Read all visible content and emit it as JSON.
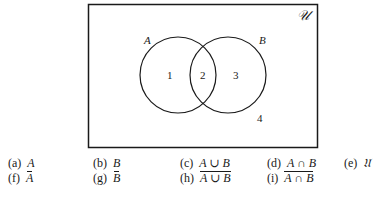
{
  "diagram": {
    "universe_label": "𝒰",
    "set_a_label": "A",
    "set_b_label": "B",
    "regions": [
      "1",
      "2",
      "3",
      "4"
    ],
    "colors": {
      "stroke": "#1a1a1a",
      "background": "#ffffff"
    }
  },
  "exercises": [
    {
      "tag": "(a)",
      "expr": "A"
    },
    {
      "tag": "(b)",
      "expr": "B"
    },
    {
      "tag": "(c)",
      "left": "A",
      "op": "∪",
      "right": "B"
    },
    {
      "tag": "(d)",
      "left": "A",
      "op": "∩",
      "right": "B"
    },
    {
      "tag": "(e)",
      "expr": "𝔘"
    },
    {
      "tag": "(f)",
      "expr": "A"
    },
    {
      "tag": "(g)",
      "expr": "B"
    },
    {
      "tag": "(h)",
      "left": "A",
      "op": "∪",
      "right": "B"
    },
    {
      "tag": "(i)",
      "left": "A",
      "op": "∩",
      "right": "B"
    }
  ]
}
